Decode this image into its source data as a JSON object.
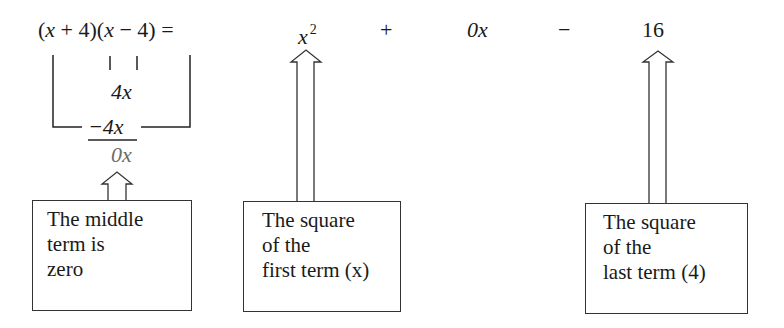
{
  "equation": {
    "lhs": "(x + 4)(x − 4) =",
    "term_square_first": "x",
    "term_square_first_exp": "2",
    "op_plus": "+",
    "term_middle": "0x",
    "op_minus": "−",
    "term_last": "16"
  },
  "work": {
    "product_inner": "4x",
    "product_outer": "−4x",
    "sum": "0x"
  },
  "callouts": [
    {
      "lines": [
        "The middle",
        "term is",
        "zero"
      ]
    },
    {
      "lines": [
        "The square",
        "of the",
        "first term (x)"
      ]
    },
    {
      "lines": [
        "The square",
        "of the",
        "last term (4)"
      ]
    }
  ],
  "colors": {
    "ink": "#1a1a1a",
    "sum_gray": "#6b6b6b",
    "box_border": "#333333"
  }
}
